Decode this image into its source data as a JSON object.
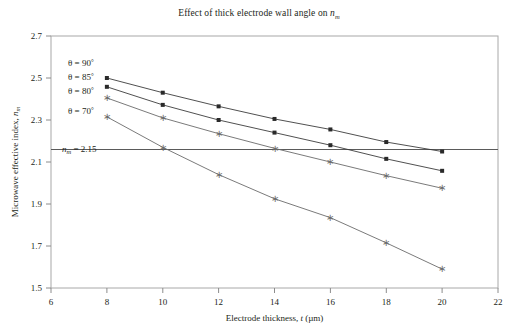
{
  "chart_data": {
    "type": "line",
    "title_plain": "Effect of thick electrode wall angle on ",
    "title_math_base": "n",
    "title_math_sub": "m",
    "xlabel": "Electrode thickness, t (µm)",
    "xlabel_plain": "Electrode thickness, ",
    "xlabel_var": "t",
    "xlabel_unit": " (µm)",
    "ylabel": "Microwave effective index, n_m",
    "ylabel_plain": "Microwave effective index, ",
    "ylabel_var": "n",
    "ylabel_sub": "m",
    "xlim": [
      6,
      22
    ],
    "ylim": [
      1.5,
      2.7
    ],
    "xticks": [
      6,
      8,
      10,
      12,
      14,
      16,
      18,
      20,
      22
    ],
    "yticks": [
      1.5,
      1.7,
      1.9,
      2.1,
      2.3,
      2.5,
      2.7
    ],
    "grid": false,
    "legend_position": "inside-upper-left",
    "x": [
      8,
      10,
      12,
      14,
      16,
      18,
      20
    ],
    "series": [
      {
        "name": "θ = 90°",
        "label_plain": "θ = 90",
        "label_deg": "°",
        "marker": "square",
        "color": "#3c3c3c",
        "values": [
          2.5,
          2.43,
          2.365,
          2.305,
          2.255,
          2.195,
          2.15
        ]
      },
      {
        "name": "θ = 85°",
        "label_plain": "θ = 85",
        "label_deg": "°",
        "marker": "square",
        "color": "#3c3c3c",
        "values": [
          2.458,
          2.372,
          2.3,
          2.24,
          2.18,
          2.115,
          2.058
        ]
      },
      {
        "name": "θ = 80°",
        "label_plain": "θ = 80",
        "label_deg": "°",
        "marker": "asterisk",
        "color": "#6b6b6b",
        "values": [
          2.405,
          2.31,
          2.235,
          2.165,
          2.1,
          2.035,
          1.975
        ]
      },
      {
        "name": "θ = 70°",
        "label_plain": "θ = 70",
        "label_deg": "°",
        "marker": "asterisk",
        "color": "#6b6b6b",
        "values": [
          2.315,
          2.17,
          2.04,
          1.925,
          1.835,
          1.715,
          1.59
        ]
      }
    ],
    "reference_line": {
      "value": 2.15,
      "label_plain": "n",
      "label_sub": "m",
      "label_eq": " = 2.15",
      "color": "#5a5a5a",
      "orientation": "horizontal"
    },
    "axis_color": "#9a9a9a",
    "text_color": "#231f20"
  }
}
